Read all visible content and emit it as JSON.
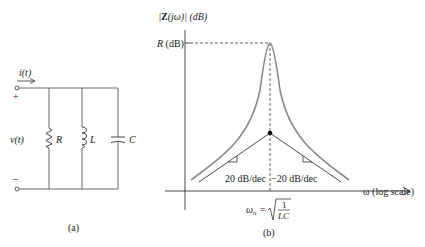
{
  "circuit": {
    "current_label": "i(t)",
    "voltage_label": "v(t)",
    "plus": "+",
    "minus": "–",
    "resistor_label": "R",
    "inductor_label": "L",
    "capacitor_label": "C",
    "caption": "(a)"
  },
  "plot": {
    "ylabel_pre": "|",
    "ylabel_bold": "Z",
    "ylabel_post": "(jω)| (dB)",
    "peak_label": "R (dB)",
    "xlabel": "ω (log scale)",
    "left_slope": "20 dB/dec",
    "right_slope": "−20 dB/dec",
    "omega_n": "ω",
    "omega_sub": "n",
    "equals": "=",
    "frac_num": "1",
    "frac_den": "LC",
    "caption": "(b)"
  },
  "colors": {
    "curve": "#8a8a8a",
    "line": "#333333"
  }
}
